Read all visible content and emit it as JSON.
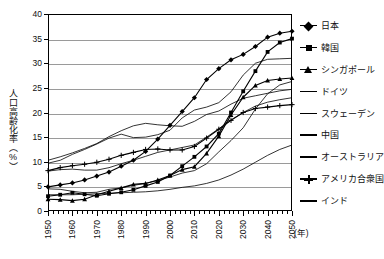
{
  "chart_data": {
    "type": "line",
    "title": "",
    "xlabel": "(年)",
    "ylabel": "人口高齢化率（%）",
    "xlim": [
      1950,
      2050
    ],
    "ylim": [
      0,
      40
    ],
    "yticks": [
      0,
      5,
      10,
      15,
      20,
      25,
      30,
      35,
      40
    ],
    "xticks": [
      1950,
      1960,
      1970,
      1980,
      1990,
      2000,
      2010,
      2020,
      2030,
      2040,
      2050
    ],
    "xtick_labels": [
      "1950",
      "1960",
      "1970",
      "1980",
      "1990",
      "2000",
      "2010",
      "2020",
      "2030",
      "2040",
      "2050"
    ],
    "grid": true,
    "legend_position": "right",
    "x": [
      1950,
      1955,
      1960,
      1965,
      1970,
      1975,
      1980,
      1985,
      1990,
      1995,
      2000,
      2005,
      2010,
      2015,
      2020,
      2025,
      2030,
      2035,
      2040,
      2045,
      2050
    ],
    "series": [
      {
        "name": "日本",
        "marker": "diamond",
        "values": [
          4.9,
          5.3,
          5.7,
          6.3,
          7.1,
          7.9,
          9.1,
          10.3,
          12.1,
          14.6,
          17.4,
          20.2,
          23.0,
          26.7,
          28.9,
          30.7,
          31.8,
          33.4,
          35.3,
          36.1,
          36.5
        ]
      },
      {
        "name": "韓国",
        "marker": "square",
        "values": [
          3.0,
          3.3,
          3.7,
          3.4,
          3.1,
          3.5,
          3.8,
          4.3,
          5.1,
          5.9,
          7.2,
          9.1,
          11.0,
          13.1,
          15.7,
          20.0,
          24.3,
          28.4,
          32.3,
          34.2,
          35.0
        ]
      },
      {
        "name": "シンガポール",
        "marker": "triangle",
        "values": [
          2.4,
          2.3,
          2.1,
          2.4,
          3.3,
          4.0,
          4.7,
          5.4,
          5.6,
          6.3,
          7.2,
          8.4,
          9.0,
          11.7,
          15.2,
          19.5,
          23.1,
          25.5,
          26.5,
          26.8,
          27.0
        ]
      },
      {
        "name": "ドイツ",
        "marker": "none",
        "values": [
          9.7,
          10.3,
          11.5,
          12.5,
          13.6,
          14.8,
          15.6,
          14.9,
          15.0,
          15.5,
          16.4,
          18.9,
          20.5,
          21.1,
          22.0,
          24.2,
          27.6,
          30.0,
          30.8,
          30.9,
          31.0
        ]
      },
      {
        "name": "スウェーデン",
        "marker": "none",
        "values": [
          10.3,
          11.0,
          11.8,
          12.7,
          13.7,
          15.1,
          16.3,
          17.3,
          17.8,
          17.5,
          17.3,
          17.2,
          18.2,
          19.6,
          20.3,
          21.7,
          22.9,
          23.4,
          23.9,
          24.4,
          24.7
        ]
      },
      {
        "name": "中国",
        "marker": "none",
        "values": [
          4.5,
          4.4,
          4.0,
          3.7,
          3.8,
          4.4,
          4.7,
          5.2,
          5.6,
          6.2,
          6.9,
          7.7,
          8.2,
          9.6,
          12.0,
          14.3,
          16.9,
          20.7,
          23.8,
          25.6,
          26.3
        ]
      },
      {
        "name": "オーストラリア",
        "marker": "none",
        "values": [
          8.1,
          8.4,
          8.5,
          8.3,
          8.3,
          8.8,
          9.6,
          10.3,
          11.1,
          11.9,
          12.4,
          12.9,
          13.4,
          15.0,
          16.7,
          18.5,
          20.0,
          21.3,
          22.1,
          22.6,
          23.0
        ]
      },
      {
        "name": "アメリカ合衆国",
        "marker": "plus",
        "values": [
          8.2,
          8.8,
          9.2,
          9.5,
          9.9,
          10.5,
          11.3,
          11.9,
          12.5,
          12.6,
          12.4,
          12.4,
          13.1,
          14.8,
          16.6,
          18.4,
          20.0,
          20.8,
          21.1,
          21.4,
          21.6
        ]
      },
      {
        "name": "インド",
        "marker": "none",
        "values": [
          3.3,
          3.3,
          3.3,
          3.4,
          3.5,
          3.6,
          3.7,
          3.8,
          3.9,
          4.1,
          4.4,
          4.8,
          5.1,
          5.6,
          6.3,
          7.3,
          8.5,
          9.9,
          11.3,
          12.5,
          13.4
        ]
      }
    ],
    "legend": [
      {
        "label": "日本",
        "marker": "diamond"
      },
      {
        "label": "韓国",
        "marker": "square"
      },
      {
        "label": "シンガポール",
        "marker": "triangle"
      },
      {
        "label": "ドイツ",
        "marker": "none"
      },
      {
        "label": "スウェーデン",
        "marker": "none"
      },
      {
        "label": "中国",
        "marker": "none"
      },
      {
        "label": "オーストラリア",
        "marker": "none"
      },
      {
        "label": "アメリカ合衆国",
        "marker": "plus"
      },
      {
        "label": "インド",
        "marker": "none"
      }
    ]
  },
  "axes": {
    "y_title": "人口高齢化率（%）",
    "x_unit": "(年)"
  },
  "colors": {
    "line": "#000000",
    "grid": "#9a9a9a",
    "frame": "#000000",
    "background": "#ffffff"
  }
}
